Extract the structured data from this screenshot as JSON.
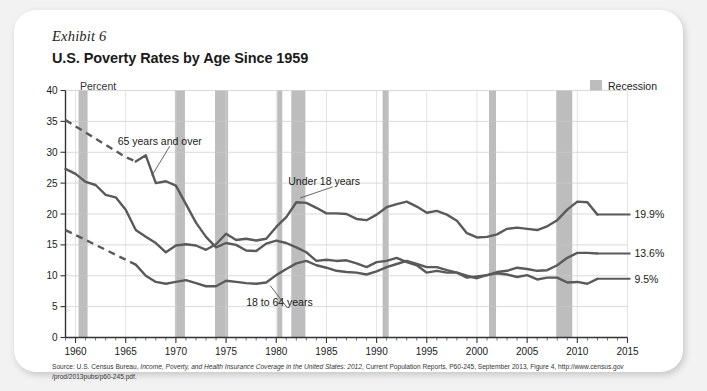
{
  "exhibit": {
    "label": "Exhibit 6"
  },
  "header": {
    "title": "U.S. Poverty Rates by Age Since 1959"
  },
  "axis": {
    "unit_label": "Percent"
  },
  "legend": {
    "recession_label": "Recession",
    "recession_color": "#bdbdbd"
  },
  "source": {
    "line1_pre": "Source: U.S. Census Bureau, ",
    "line1_italic": "Income, Poverty, and Health Insurance Coverage in the United States: 2012",
    "line1_post": ", Current Population Reports, P60-245, September 2013, Figure 4, http://www.census.gov",
    "line2": "/prod/2013pubs/p60-245.pdf."
  },
  "chart_data": {
    "type": "line",
    "title": "U.S. Poverty Rates by Age Since 1959",
    "xlabel": "",
    "ylabel": "Percent",
    "xlim": [
      1959,
      2015
    ],
    "ylim": [
      0,
      40
    ],
    "yticks": [
      0,
      5,
      10,
      15,
      20,
      25,
      30,
      35,
      40
    ],
    "xticks": [
      1960,
      1965,
      1970,
      1975,
      1980,
      1985,
      1990,
      1995,
      2000,
      2005,
      2010,
      2015
    ],
    "xtick_minor_step": 1,
    "grid": "horizontal",
    "legend_position": "top-right",
    "line_color": "#5a5a5a",
    "series": [
      {
        "name": "65 years and over",
        "end_label": "9.5%",
        "dashed_through": 1966,
        "x": [
          1959,
          1960,
          1961,
          1962,
          1963,
          1964,
          1965,
          1966,
          1967,
          1968,
          1969,
          1970,
          1971,
          1972,
          1973,
          1974,
          1975,
          1976,
          1977,
          1978,
          1979,
          1980,
          1981,
          1982,
          1983,
          1984,
          1985,
          1986,
          1987,
          1988,
          1989,
          1990,
          1991,
          1992,
          1993,
          1994,
          1995,
          1996,
          1997,
          1998,
          1999,
          2000,
          2001,
          2002,
          2003,
          2004,
          2005,
          2006,
          2007,
          2008,
          2009,
          2010,
          2011,
          2012
        ],
        "values": [
          35.2,
          34.2,
          33.2,
          32.2,
          31.2,
          30.2,
          29.2,
          28.5,
          29.5,
          25.0,
          25.3,
          24.6,
          21.6,
          18.6,
          16.3,
          14.6,
          15.3,
          15.0,
          14.1,
          14.0,
          15.2,
          15.7,
          15.3,
          14.6,
          13.8,
          12.4,
          12.6,
          12.4,
          12.5,
          12.0,
          11.4,
          12.2,
          12.4,
          12.9,
          12.2,
          11.7,
          10.5,
          10.8,
          10.5,
          10.5,
          9.7,
          9.9,
          10.1,
          10.4,
          10.2,
          9.8,
          10.1,
          9.4,
          9.7,
          9.7,
          8.9,
          9.0,
          8.7,
          9.5
        ]
      },
      {
        "name": "Under 18 years",
        "end_label": "19.9%",
        "dashed_through": null,
        "x": [
          1959,
          1960,
          1961,
          1962,
          1963,
          1964,
          1965,
          1966,
          1967,
          1968,
          1969,
          1970,
          1971,
          1972,
          1973,
          1974,
          1975,
          1976,
          1977,
          1978,
          1979,
          1980,
          1981,
          1982,
          1983,
          1984,
          1985,
          1986,
          1987,
          1988,
          1989,
          1990,
          1991,
          1992,
          1993,
          1994,
          1995,
          1996,
          1997,
          1998,
          1999,
          2000,
          2001,
          2002,
          2003,
          2004,
          2005,
          2006,
          2007,
          2008,
          2009,
          2010,
          2011,
          2012
        ],
        "values": [
          27.3,
          26.5,
          25.2,
          24.7,
          23.1,
          22.7,
          20.7,
          17.4,
          16.3,
          15.3,
          13.8,
          14.9,
          15.1,
          14.9,
          14.2,
          15.1,
          16.8,
          15.8,
          16.0,
          15.7,
          16.0,
          17.9,
          19.5,
          21.9,
          21.8,
          21.0,
          20.1,
          20.1,
          20.0,
          19.2,
          19.0,
          19.9,
          21.1,
          21.6,
          22.0,
          21.2,
          20.2,
          20.5,
          19.9,
          18.9,
          16.9,
          16.2,
          16.3,
          16.7,
          17.6,
          17.8,
          17.6,
          17.4,
          18.0,
          19.0,
          20.7,
          22.0,
          21.9,
          19.9
        ]
      },
      {
        "name": "18 to 64 years",
        "end_label": "13.6%",
        "dashed_through": 1966,
        "x": [
          1959,
          1960,
          1961,
          1962,
          1963,
          1964,
          1965,
          1966,
          1967,
          1968,
          1969,
          1970,
          1971,
          1972,
          1973,
          1974,
          1975,
          1976,
          1977,
          1978,
          1979,
          1980,
          1981,
          1982,
          1983,
          1984,
          1985,
          1986,
          1987,
          1988,
          1989,
          1990,
          1991,
          1992,
          1993,
          1994,
          1995,
          1996,
          1997,
          1998,
          1999,
          2000,
          2001,
          2002,
          2003,
          2004,
          2005,
          2006,
          2007,
          2008,
          2009,
          2010,
          2011,
          2012
        ],
        "values": [
          17.4,
          16.6,
          15.8,
          15.0,
          14.2,
          13.4,
          12.6,
          11.8,
          10.0,
          9.0,
          8.7,
          9.0,
          9.3,
          8.8,
          8.3,
          8.3,
          9.2,
          9.0,
          8.8,
          8.7,
          8.9,
          10.1,
          11.1,
          12.0,
          12.4,
          11.7,
          11.3,
          10.8,
          10.6,
          10.5,
          10.2,
          10.7,
          11.4,
          11.9,
          12.4,
          11.9,
          11.4,
          11.4,
          10.9,
          10.5,
          10.0,
          9.6,
          10.1,
          10.6,
          10.8,
          11.3,
          11.1,
          10.8,
          10.9,
          11.7,
          12.9,
          13.7,
          13.7,
          13.6
        ]
      }
    ],
    "recessions": [
      {
        "start": 1960.3,
        "end": 1961.2
      },
      {
        "start": 1969.9,
        "end": 1970.9
      },
      {
        "start": 1973.9,
        "end": 1975.2
      },
      {
        "start": 1980.1,
        "end": 1980.6
      },
      {
        "start": 1981.5,
        "end": 1982.9
      },
      {
        "start": 1990.6,
        "end": 1991.2
      },
      {
        "start": 2001.2,
        "end": 2001.9
      },
      {
        "start": 2007.9,
        "end": 2009.5
      }
    ],
    "annotations": [
      {
        "text": "65 years and over",
        "x": 1964.2,
        "y": 31.8
      },
      {
        "text": "Under 18 years",
        "x": 1981.2,
        "y": 25.2
      },
      {
        "text": "18 to 64 years",
        "x": 1977.0,
        "y": 5.6
      }
    ]
  }
}
